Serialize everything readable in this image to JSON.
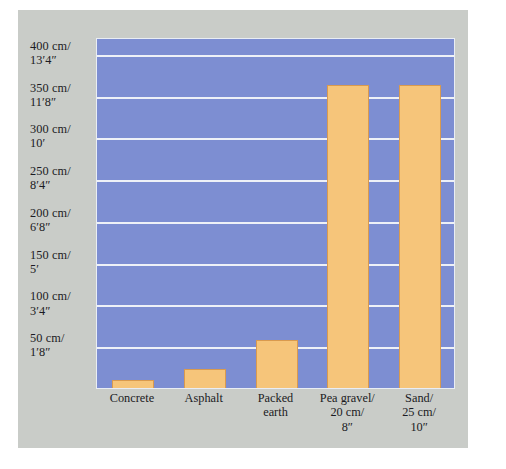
{
  "chart_data": {
    "type": "bar",
    "title": "",
    "subtitle": "",
    "xlabel": "",
    "ylabel": "",
    "ylim": [
      0,
      420
    ],
    "grid": true,
    "legend": false,
    "units": "cm",
    "categories": [
      "Concrete",
      "Asphalt",
      "Packed\nearth",
      "Pea gravel/\n20 cm/\n8″",
      "Sand/\n25 cm/\n10″"
    ],
    "category_lines": [
      [
        "Concrete"
      ],
      [
        "Asphalt"
      ],
      [
        "Packed",
        "earth"
      ],
      [
        "Pea gravel/",
        "20 cm/",
        "8″"
      ],
      [
        "Sand/",
        "25 cm/",
        "10″"
      ]
    ],
    "values": [
      10,
      23,
      58,
      362,
      362
    ],
    "ytick_values": [
      400,
      350,
      300,
      250,
      200,
      150,
      100,
      50
    ],
    "ytick_labels": [
      {
        "line1": "400 cm/",
        "line2": "13′4″"
      },
      {
        "line1": "350 cm/",
        "line2": "11′8″"
      },
      {
        "line1": "300 cm/",
        "line2": "10′"
      },
      {
        "line1": "250 cm/",
        "line2": "8′4″"
      },
      {
        "line1": "200 cm/",
        "line2": "6′8″"
      },
      {
        "line1": "150 cm/",
        "line2": "5′"
      },
      {
        "line1": "100 cm/",
        "line2": "3′4″"
      },
      {
        "line1": "50 cm/",
        "line2": "1′8″"
      }
    ],
    "colors": {
      "plot_background": "#7d8ed2",
      "bar_fill": "#f6c57a",
      "bar_border": "#d99a4e",
      "gridline": "#eef1f7",
      "panel_background": "#c9ccc8",
      "page_background": "#ffffff",
      "text": "#1b1b23"
    }
  }
}
